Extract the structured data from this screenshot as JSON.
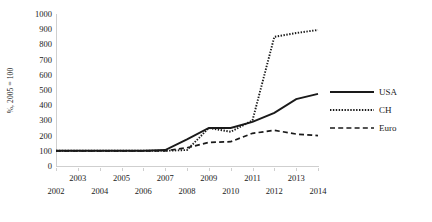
{
  "chart_data": {
    "type": "line",
    "title": "",
    "xlabel": "",
    "ylabel": "%, 2005 = 100",
    "x": [
      2002,
      2003,
      2004,
      2005,
      2006,
      2007,
      2008,
      2009,
      2010,
      2011,
      2012,
      2013,
      2014
    ],
    "xlim": [
      2002,
      2014
    ],
    "ylim": [
      0,
      1000
    ],
    "grid": false,
    "legend_position": "right",
    "y_ticks": [
      0,
      100,
      200,
      300,
      400,
      500,
      600,
      700,
      800,
      900,
      1000
    ],
    "y_tick_labels": [
      "0",
      "100",
      "200",
      "300",
      "400",
      "500",
      "600",
      "700",
      "800",
      "900",
      "1000"
    ],
    "x_tick_labels_top": [
      "2003",
      "2005",
      "2007",
      "2009",
      "2011",
      "2013"
    ],
    "x_tick_labels_bottom": [
      "2002",
      "2004",
      "2006",
      "2008",
      "2010",
      "2012",
      "2014"
    ],
    "series": [
      {
        "name": "USA",
        "style": "solid",
        "color": "#1a1a1a",
        "values": [
          100,
          100,
          100,
          100,
          100,
          105,
          175,
          250,
          250,
          290,
          350,
          440,
          475
        ]
      },
      {
        "name": "CH",
        "style": "dotted",
        "color": "#1a1a1a",
        "values": [
          100,
          100,
          100,
          100,
          100,
          100,
          105,
          250,
          225,
          300,
          850,
          875,
          895
        ]
      },
      {
        "name": "Euro",
        "style": "dashed",
        "color": "#1a1a1a",
        "values": [
          100,
          100,
          100,
          100,
          100,
          100,
          120,
          155,
          160,
          215,
          235,
          210,
          200
        ]
      }
    ]
  },
  "legend": {
    "entries": [
      {
        "label": "USA",
        "style": "solid"
      },
      {
        "label": "CH",
        "style": "dotted"
      },
      {
        "label": "Euro",
        "style": "dashed"
      }
    ]
  }
}
